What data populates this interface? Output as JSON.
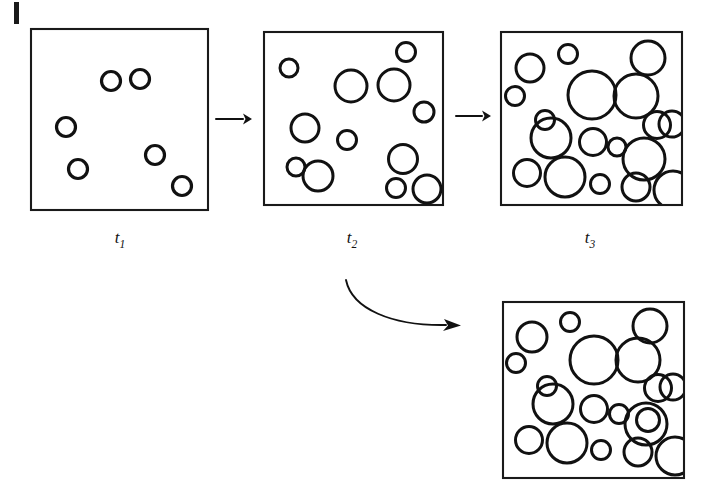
{
  "figure": {
    "title": "Bubble coarsening sequence",
    "background_color": "#ffffff",
    "stroke_color": "#111111",
    "frame_color": "#1a1a1a",
    "width": 711,
    "height": 495
  },
  "page_marks": {
    "left_edge_tick": {
      "x": 14,
      "y": 2,
      "width": 5,
      "height": 22
    }
  },
  "panels": [
    {
      "id": "panel-t1",
      "label": "t",
      "label_subscript": "1",
      "label_x": 120,
      "label_y": 243,
      "frame": {
        "x": 31,
        "y": 29,
        "width": 177,
        "height": 181
      },
      "bubble_count": 6,
      "bubbles": [
        {
          "cx": 111,
          "cy": 81,
          "r": 9.5
        },
        {
          "cx": 140,
          "cy": 79,
          "r": 9.5
        },
        {
          "cx": 66,
          "cy": 127,
          "r": 9.5
        },
        {
          "cx": 78,
          "cy": 169,
          "r": 9.5
        },
        {
          "cx": 155,
          "cy": 155,
          "r": 9.5
        },
        {
          "cx": 182,
          "cy": 186,
          "r": 9.5
        }
      ]
    },
    {
      "id": "panel-t2",
      "label": "t",
      "label_subscript": "2",
      "label_x": 352,
      "label_y": 243,
      "frame": {
        "x": 264,
        "y": 32,
        "width": 179,
        "height": 173
      },
      "bubble_count": 13,
      "bubbles": [
        {
          "cx": 289,
          "cy": 68,
          "r": 9.0
        },
        {
          "cx": 406,
          "cy": 52,
          "r": 9.5
        },
        {
          "cx": 351,
          "cy": 86,
          "r": 16.0
        },
        {
          "cx": 394,
          "cy": 85,
          "r": 16.0
        },
        {
          "cx": 424,
          "cy": 112,
          "r": 10.0
        },
        {
          "cx": 305,
          "cy": 128,
          "r": 14.0
        },
        {
          "cx": 347,
          "cy": 140,
          "r": 9.5
        },
        {
          "cx": 296,
          "cy": 167,
          "r": 9.0
        },
        {
          "cx": 318,
          "cy": 176,
          "r": 15.0
        },
        {
          "cx": 403,
          "cy": 159,
          "r": 14.5
        },
        {
          "cx": 396,
          "cy": 188,
          "r": 9.5
        },
        {
          "cx": 427,
          "cy": 189,
          "r": 14.0
        }
      ]
    },
    {
      "id": "panel-t3",
      "label": "t",
      "label_subscript": "3",
      "label_x": 590,
      "label_y": 243,
      "frame": {
        "x": 501,
        "y": 32,
        "width": 181,
        "height": 173
      },
      "bubble_count": 19,
      "bubbles": [
        {
          "cx": 568,
          "cy": 54,
          "r": 9.5
        },
        {
          "cx": 530,
          "cy": 68,
          "r": 14.0
        },
        {
          "cx": 648,
          "cy": 58,
          "r": 17.0
        },
        {
          "cx": 515,
          "cy": 96,
          "r": 9.5
        },
        {
          "cx": 592,
          "cy": 95,
          "r": 24.0
        },
        {
          "cx": 636,
          "cy": 96,
          "r": 22.0
        },
        {
          "cx": 657,
          "cy": 125,
          "r": 13.5
        },
        {
          "cx": 672,
          "cy": 124,
          "r": 13.0
        },
        {
          "cx": 545,
          "cy": 120,
          "r": 9.5
        },
        {
          "cx": 551,
          "cy": 138,
          "r": 20.0
        },
        {
          "cx": 593,
          "cy": 142,
          "r": 13.5
        },
        {
          "cx": 617,
          "cy": 147,
          "r": 9.0
        },
        {
          "cx": 644,
          "cy": 159,
          "r": 21.0
        },
        {
          "cx": 527,
          "cy": 173,
          "r": 13.5
        },
        {
          "cx": 565,
          "cy": 177,
          "r": 20.0
        },
        {
          "cx": 600,
          "cy": 184,
          "r": 9.5
        },
        {
          "cx": 636,
          "cy": 187,
          "r": 14.0
        },
        {
          "cx": 673,
          "cy": 190,
          "r": 19.0
        }
      ]
    },
    {
      "id": "panel-t2-alt",
      "label": "",
      "label_subscript": "",
      "label_x": 593,
      "label_y": 492,
      "frame": {
        "x": 503,
        "y": 302,
        "width": 181,
        "height": 176
      },
      "bubble_count": 19,
      "bubbles": [
        {
          "cx": 570,
          "cy": 322,
          "r": 9.5
        },
        {
          "cx": 532,
          "cy": 337,
          "r": 15.0
        },
        {
          "cx": 650,
          "cy": 326,
          "r": 17.0
        },
        {
          "cx": 516,
          "cy": 363,
          "r": 9.5
        },
        {
          "cx": 594,
          "cy": 360,
          "r": 24.0
        },
        {
          "cx": 638,
          "cy": 360,
          "r": 22.0
        },
        {
          "cx": 658,
          "cy": 388,
          "r": 13.5
        },
        {
          "cx": 673,
          "cy": 387,
          "r": 13.0
        },
        {
          "cx": 547,
          "cy": 386,
          "r": 9.5
        },
        {
          "cx": 553,
          "cy": 404,
          "r": 20.0
        },
        {
          "cx": 594,
          "cy": 409,
          "r": 13.5
        },
        {
          "cx": 619,
          "cy": 414,
          "r": 9.5
        },
        {
          "cx": 646,
          "cy": 424,
          "r": 21.0
        },
        {
          "cx": 648,
          "cy": 420,
          "r": 11.5
        },
        {
          "cx": 529,
          "cy": 440,
          "r": 13.5
        },
        {
          "cx": 567,
          "cy": 443,
          "r": 20.0
        },
        {
          "cx": 601,
          "cy": 450,
          "r": 9.5
        },
        {
          "cx": 638,
          "cy": 452,
          "r": 14.0
        },
        {
          "cx": 675,
          "cy": 456,
          "r": 19.0
        }
      ]
    }
  ],
  "arrows": [
    {
      "id": "arrow-t1-t2",
      "type": "straight",
      "from_panel": "panel-t1",
      "to_panel": "panel-t2",
      "x1": 216,
      "y1": 119,
      "x2": 248,
      "y2": 119
    },
    {
      "id": "arrow-t2-t3",
      "type": "straight",
      "from_panel": "panel-t2",
      "to_panel": "panel-t3",
      "x1": 456,
      "y1": 116,
      "x2": 489,
      "y2": 116
    },
    {
      "id": "arrow-t2-alt",
      "type": "curved",
      "from_panel": "panel-t2",
      "to_panel": "panel-t2-alt",
      "path": "M 346,280 C 352,309 392,326 452,325"
    }
  ]
}
